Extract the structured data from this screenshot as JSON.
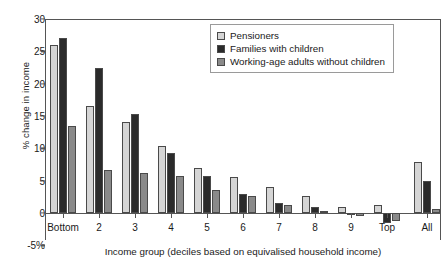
{
  "chart_data": {
    "type": "bar",
    "title": "",
    "xlabel": "Income group (deciles based on equivalised household income)",
    "ylabel": "% change in income",
    "ylim": [
      -5,
      30
    ],
    "yticks": [
      30,
      25,
      20,
      15,
      10,
      5,
      0,
      -5
    ],
    "ytick_labels": [
      "30",
      "25",
      "20",
      "15",
      "10",
      "5",
      "0",
      "-5%"
    ],
    "grid": false,
    "legend_position": "top-right inside",
    "categories": [
      "Bottom",
      "2",
      "3",
      "4",
      "5",
      "6",
      "7",
      "8",
      "9",
      "Top",
      "All"
    ],
    "series": [
      {
        "name": "Pensioners",
        "color": "#d5d5d5",
        "values": [
          26.0,
          16.6,
          14.0,
          10.3,
          7.0,
          5.5,
          4.1,
          2.7,
          1.0,
          1.2,
          7.9
        ]
      },
      {
        "name": "Families with children",
        "color": "#2b2b2b",
        "values": [
          27.0,
          22.4,
          15.3,
          9.3,
          5.8,
          3.0,
          1.6,
          1.0,
          -0.3,
          -1.6,
          5.0
        ]
      },
      {
        "name": "Working-age adults without children",
        "color": "#8a8a8a",
        "values": [
          13.5,
          6.7,
          6.2,
          5.8,
          3.5,
          2.6,
          1.2,
          0.2,
          -0.5,
          -1.2,
          0.6
        ]
      }
    ]
  },
  "legend": {
    "items": [
      {
        "label": "Pensioners",
        "color": "#d5d5d5"
      },
      {
        "label": "Families with children",
        "color": "#2b2b2b"
      },
      {
        "label": "Working-age adults without children",
        "color": "#8a8a8a"
      }
    ]
  },
  "axes": {
    "y_title": "% change in income",
    "x_title": "Income group (deciles based on equivalised household income)"
  }
}
